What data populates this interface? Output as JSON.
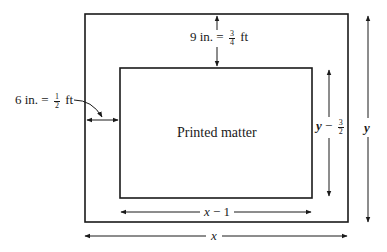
{
  "diagram": {
    "inner_label": "Printed matter",
    "top_margin": {
      "prefix": "9 in. =",
      "num": "3",
      "den": "4",
      "unit": "ft"
    },
    "side_margin": {
      "prefix": "6 in. =",
      "num": "1",
      "den": "2",
      "unit": "ft"
    },
    "inner_height": {
      "var": "y",
      "op": "−",
      "num": "3",
      "den": "2"
    },
    "outer_height": {
      "var": "y"
    },
    "inner_width": {
      "var": "x",
      "rest": "− 1"
    },
    "outer_width": {
      "var": "x"
    },
    "stroke_color": "#1a1a1a"
  }
}
